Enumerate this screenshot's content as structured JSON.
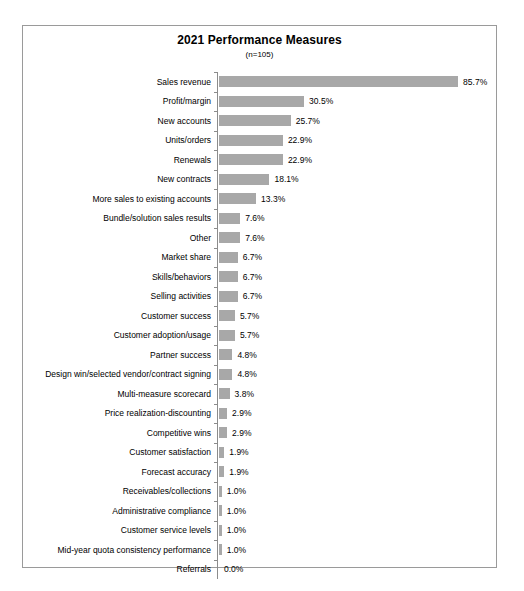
{
  "chart_data": {
    "type": "bar",
    "orientation": "horizontal",
    "title": "2021 Performance Measures",
    "subtitle": "(n=105)",
    "xlabel": "",
    "ylabel": "",
    "xlim": [
      0,
      100
    ],
    "grid": false,
    "legend": null,
    "value_suffix": "%",
    "bar_color": "#a8a8a8",
    "axis_color": "#8c8c8c",
    "border_color": "#9a9a9a",
    "background": "#ffffff",
    "categories": [
      "Sales revenue",
      "Profit/margin",
      "New accounts",
      "Units/orders",
      "Renewals",
      "New contracts",
      "More sales to existing accounts",
      "Bundle/solution sales results",
      "Other",
      "Market share",
      "Skills/behaviors",
      "Selling activities",
      "Customer success",
      "Customer adoption/usage",
      "Partner success",
      "Design win/selected vendor/contract signing",
      "Multi-measure scorecard",
      "Price realization-discounting",
      "Competitive wins",
      "Customer satisfaction",
      "Forecast accuracy",
      "Receivables/collections",
      "Administrative compliance",
      "Customer service levels",
      "Mid-year quota consistency performance",
      "Referrals"
    ],
    "values": [
      85.7,
      30.5,
      25.7,
      22.9,
      22.9,
      18.1,
      13.3,
      7.6,
      7.6,
      6.7,
      6.7,
      6.7,
      5.7,
      5.7,
      4.8,
      4.8,
      3.8,
      2.9,
      2.9,
      1.9,
      1.9,
      1.0,
      1.0,
      1.0,
      1.0,
      0.0
    ],
    "value_labels": [
      "85.7%",
      "30.5%",
      "25.7%",
      "22.9%",
      "22.9%",
      "18.1%",
      "13.3%",
      "7.6%",
      "7.6%",
      "6.7%",
      "6.7%",
      "6.7%",
      "5.7%",
      "5.7%",
      "4.8%",
      "4.8%",
      "3.8%",
      "2.9%",
      "2.9%",
      "1.9%",
      "1.9%",
      "1.0%",
      "1.0%",
      "1.0%",
      "1.0%",
      "0.0%"
    ]
  }
}
